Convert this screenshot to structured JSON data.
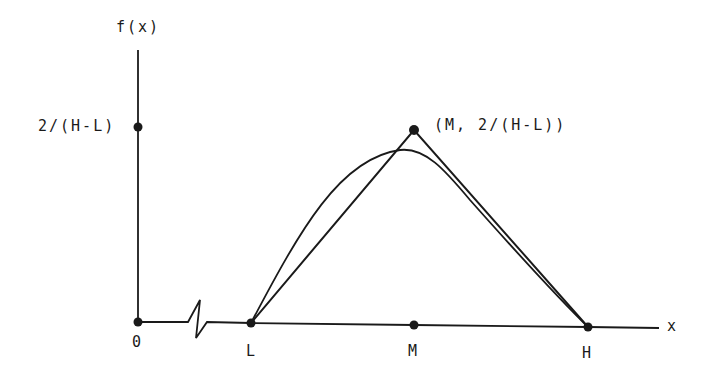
{
  "diagram": {
    "type": "triangular-distribution-pdf",
    "y_axis_label": "f(x)",
    "x_axis_label": "x",
    "y_tick_label": "2/(H-L)",
    "origin_label": "0",
    "x_points": [
      {
        "label": "L"
      },
      {
        "label": "M"
      },
      {
        "label": "H"
      }
    ],
    "peak_label": "(M, 2/(H-L))",
    "curves": [
      "triangular pdf (straight lines L→peak→H)",
      "smooth approximating curve (beta-like)"
    ],
    "axis_break": true,
    "colors": {
      "ink": "#1a1a1a",
      "background": "#ffffff"
    }
  }
}
